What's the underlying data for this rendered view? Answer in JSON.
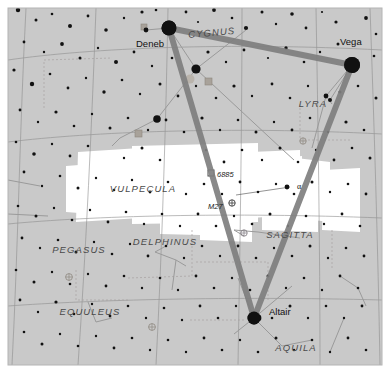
{
  "map": {
    "title": "Summer Triangle star chart",
    "width": 390,
    "height": 373,
    "background_color": "#ffffff",
    "sky_fill_color": "#c9c9c9",
    "milky_way_color": "#ffffff",
    "grid_line_color": "#8e8e8e",
    "border_color": "#b4b4b4",
    "asterism_line_color": "#7f7f7f",
    "constellation_line_color": "#9a9a9a",
    "star_color": "#111111",
    "dso_marker_color": "#a09a90"
  },
  "constellations": [
    {
      "name": "CYGNUS",
      "x": 212,
      "y": 36,
      "rotation": -5
    },
    {
      "name": "LYRA",
      "x": 313,
      "y": 107,
      "rotation": 0
    },
    {
      "name": "VULPECULA",
      "x": 143,
      "y": 192,
      "rotation": 0
    },
    {
      "name": "PEGASUS",
      "x": 79,
      "y": 253,
      "rotation": 0
    },
    {
      "name": "DELPHINUS",
      "x": 165,
      "y": 245,
      "rotation": 0
    },
    {
      "name": "SAGITTA",
      "x": 290,
      "y": 238,
      "rotation": 0
    },
    {
      "name": "EQUULEUS",
      "x": 90,
      "y": 315,
      "rotation": 0
    },
    {
      "name": "AQUILA",
      "x": 296,
      "y": 351,
      "rotation": 0
    }
  ],
  "named_stars": [
    {
      "name": "Deneb",
      "label_x": 136,
      "label_y": 47,
      "x": 169,
      "y": 28,
      "r": 7.5
    },
    {
      "name": "Vega",
      "label_x": 340,
      "label_y": 45,
      "x": 352,
      "y": 65,
      "r": 8.0
    },
    {
      "name": "Altair",
      "label_x": 269,
      "label_y": 315,
      "x": 254,
      "y": 318,
      "r": 6.5
    }
  ],
  "deep_sky_objects": [
    {
      "name": "6885",
      "label_x": 217,
      "label_y": 177,
      "marker_x": 211,
      "marker_y": 173,
      "type": "open-cluster"
    },
    {
      "name": "M27",
      "label_x": 208,
      "label_y": 209,
      "marker_x": 232,
      "marker_y": 203,
      "type": "planetary-nebula"
    }
  ],
  "greek_labels": [
    {
      "name": "α",
      "x": 297,
      "y": 189,
      "star_x": 287,
      "star_y": 187
    }
  ],
  "asterism": {
    "name": "Summer Triangle",
    "vertices": [
      {
        "star": "Deneb",
        "x": 169,
        "y": 28
      },
      {
        "star": "Vega",
        "x": 352,
        "y": 65
      },
      {
        "star": "Altair",
        "x": 254,
        "y": 318
      }
    ]
  },
  "chart_data": {
    "type": "scatter",
    "xlabel": "",
    "ylabel": "",
    "grid": true,
    "legend_position": "none",
    "note": "Star positions in pixel coordinates; radius encodes apparent magnitude (larger = brighter).",
    "stars": [
      [
        169,
        28,
        7.5
      ],
      [
        352,
        65,
        8.0
      ],
      [
        254,
        318,
        6.5
      ],
      [
        196,
        69,
        4.6
      ],
      [
        157,
        119,
        3.8
      ],
      [
        258,
        318,
        3.4
      ],
      [
        18,
        10,
        2.2
      ],
      [
        36,
        20,
        1.5
      ],
      [
        52,
        14,
        1.3
      ],
      [
        70,
        26,
        2.0
      ],
      [
        88,
        16,
        1.4
      ],
      [
        106,
        30,
        1.8
      ],
      [
        124,
        18,
        1.2
      ],
      [
        142,
        12,
        1.6
      ],
      [
        146,
        30,
        2.4
      ],
      [
        156,
        10,
        1.3
      ],
      [
        186,
        12,
        1.4
      ],
      [
        198,
        22,
        1.1
      ],
      [
        214,
        10,
        1.9
      ],
      [
        232,
        18,
        1.3
      ],
      [
        246,
        28,
        2.1
      ],
      [
        262,
        12,
        1.5
      ],
      [
        276,
        24,
        1.2
      ],
      [
        292,
        14,
        1.8
      ],
      [
        306,
        28,
        1.4
      ],
      [
        322,
        12,
        1.1
      ],
      [
        336,
        22,
        1.6
      ],
      [
        366,
        18,
        1.9
      ],
      [
        376,
        34,
        1.3
      ],
      [
        24,
        42,
        1.4
      ],
      [
        44,
        52,
        1.2
      ],
      [
        62,
        44,
        1.9
      ],
      [
        80,
        58,
        1.5
      ],
      [
        98,
        48,
        1.2
      ],
      [
        116,
        62,
        2.0
      ],
      [
        134,
        52,
        1.4
      ],
      [
        152,
        66,
        1.2
      ],
      [
        172,
        58,
        1.3
      ],
      [
        208,
        52,
        1.6
      ],
      [
        226,
        62,
        1.2
      ],
      [
        244,
        50,
        1.4
      ],
      [
        268,
        58,
        1.1
      ],
      [
        286,
        48,
        1.7
      ],
      [
        304,
        62,
        1.3
      ],
      [
        320,
        52,
        1.2
      ],
      [
        338,
        44,
        1.5
      ],
      [
        374,
        56,
        1.3
      ],
      [
        14,
        70,
        1.6
      ],
      [
        32,
        84,
        2.2
      ],
      [
        50,
        74,
        1.3
      ],
      [
        68,
        88,
        1.4
      ],
      [
        86,
        78,
        1.2
      ],
      [
        104,
        92,
        1.7
      ],
      [
        122,
        80,
        1.3
      ],
      [
        140,
        94,
        1.2
      ],
      [
        160,
        84,
        1.5
      ],
      [
        178,
        96,
        1.4
      ],
      [
        196,
        86,
        1.2
      ],
      [
        216,
        98,
        1.3
      ],
      [
        234,
        86,
        1.6
      ],
      [
        252,
        96,
        1.2
      ],
      [
        272,
        84,
        1.4
      ],
      [
        290,
        98,
        1.3
      ],
      [
        308,
        86,
        1.2
      ],
      [
        326,
        96,
        2.4
      ],
      [
        330,
        100,
        2.0
      ],
      [
        340,
        92,
        1.5
      ],
      [
        358,
        86,
        1.3
      ],
      [
        376,
        98,
        1.5
      ],
      [
        20,
        110,
        1.4
      ],
      [
        38,
        122,
        1.2
      ],
      [
        56,
        112,
        1.6
      ],
      [
        74,
        126,
        1.3
      ],
      [
        92,
        114,
        1.2
      ],
      [
        110,
        128,
        1.5
      ],
      [
        128,
        118,
        1.3
      ],
      [
        148,
        130,
        1.2
      ],
      [
        166,
        120,
        1.4
      ],
      [
        184,
        132,
        1.3
      ],
      [
        202,
        118,
        1.6
      ],
      [
        220,
        130,
        1.2
      ],
      [
        238,
        120,
        1.3
      ],
      [
        256,
        132,
        1.5
      ],
      [
        274,
        122,
        1.2
      ],
      [
        292,
        130,
        1.4
      ],
      [
        310,
        118,
        1.3
      ],
      [
        328,
        132,
        1.2
      ],
      [
        346,
        122,
        1.6
      ],
      [
        364,
        130,
        1.3
      ],
      [
        16,
        142,
        1.3
      ],
      [
        34,
        154,
        1.8
      ],
      [
        52,
        144,
        1.2
      ],
      [
        70,
        156,
        1.4
      ],
      [
        88,
        146,
        1.3
      ],
      [
        124,
        158,
        1.2
      ],
      [
        142,
        148,
        1.5
      ],
      [
        160,
        160,
        1.3
      ],
      [
        206,
        150,
        1.2
      ],
      [
        224,
        162,
        1.4
      ],
      [
        242,
        150,
        1.3
      ],
      [
        262,
        160,
        1.2
      ],
      [
        280,
        148,
        1.5
      ],
      [
        298,
        162,
        1.3
      ],
      [
        316,
        150,
        1.2
      ],
      [
        334,
        160,
        1.4
      ],
      [
        352,
        148,
        1.3
      ],
      [
        370,
        158,
        1.5
      ],
      [
        24,
        172,
        1.4
      ],
      [
        42,
        186,
        1.2
      ],
      [
        60,
        176,
        1.3
      ],
      [
        78,
        188,
        1.5
      ],
      [
        96,
        178,
        1.2
      ],
      [
        114,
        190,
        1.3
      ],
      [
        132,
        180,
        1.2
      ],
      [
        150,
        192,
        1.4
      ],
      [
        168,
        182,
        1.3
      ],
      [
        186,
        194,
        1.2
      ],
      [
        204,
        184,
        1.3
      ],
      [
        222,
        194,
        1.2
      ],
      [
        240,
        182,
        1.4
      ],
      [
        258,
        192,
        1.3
      ],
      [
        276,
        184,
        1.2
      ],
      [
        294,
        194,
        1.3
      ],
      [
        312,
        182,
        1.5
      ],
      [
        330,
        192,
        1.2
      ],
      [
        348,
        184,
        1.3
      ],
      [
        366,
        194,
        1.4
      ],
      [
        18,
        206,
        1.3
      ],
      [
        36,
        216,
        1.5
      ],
      [
        54,
        208,
        1.2
      ],
      [
        72,
        220,
        1.3
      ],
      [
        90,
        210,
        1.2
      ],
      [
        108,
        222,
        1.4
      ],
      [
        126,
        212,
        1.3
      ],
      [
        144,
        224,
        1.2
      ],
      [
        162,
        214,
        1.3
      ],
      [
        180,
        226,
        1.2
      ],
      [
        198,
        214,
        1.4
      ],
      [
        216,
        226,
        1.3
      ],
      [
        234,
        216,
        1.2
      ],
      [
        252,
        224,
        1.3
      ],
      [
        270,
        214,
        1.5
      ],
      [
        288,
        226,
        1.2
      ],
      [
        306,
        216,
        1.3
      ],
      [
        324,
        224,
        1.2
      ],
      [
        342,
        214,
        1.4
      ],
      [
        360,
        226,
        1.3
      ],
      [
        22,
        238,
        1.4
      ],
      [
        40,
        248,
        1.2
      ],
      [
        58,
        240,
        1.3
      ],
      [
        76,
        252,
        1.5
      ],
      [
        94,
        242,
        1.2
      ],
      [
        112,
        254,
        1.3
      ],
      [
        130,
        244,
        1.2
      ],
      [
        148,
        256,
        1.4
      ],
      [
        166,
        246,
        1.3
      ],
      [
        184,
        258,
        1.2
      ],
      [
        202,
        246,
        1.3
      ],
      [
        220,
        256,
        1.2
      ],
      [
        238,
        246,
        1.4
      ],
      [
        256,
        258,
        1.3
      ],
      [
        274,
        248,
        1.2
      ],
      [
        292,
        256,
        1.3
      ],
      [
        310,
        246,
        1.5
      ],
      [
        328,
        258,
        1.2
      ],
      [
        346,
        248,
        1.3
      ],
      [
        364,
        256,
        1.4
      ],
      [
        16,
        270,
        1.3
      ],
      [
        34,
        282,
        1.5
      ],
      [
        52,
        272,
        1.2
      ],
      [
        70,
        284,
        1.3
      ],
      [
        88,
        274,
        1.2
      ],
      [
        106,
        286,
        1.4
      ],
      [
        124,
        276,
        1.3
      ],
      [
        142,
        288,
        1.2
      ],
      [
        160,
        278,
        1.3
      ],
      [
        178,
        290,
        1.2
      ],
      [
        196,
        276,
        1.4
      ],
      [
        214,
        288,
        1.3
      ],
      [
        232,
        278,
        1.2
      ],
      [
        250,
        290,
        1.3
      ],
      [
        268,
        276,
        1.5
      ],
      [
        286,
        288,
        1.2
      ],
      [
        304,
        278,
        1.3
      ],
      [
        322,
        290,
        1.2
      ],
      [
        340,
        276,
        1.4
      ],
      [
        358,
        288,
        1.3
      ],
      [
        20,
        300,
        1.4
      ],
      [
        38,
        312,
        1.2
      ],
      [
        56,
        302,
        1.6
      ],
      [
        74,
        314,
        1.3
      ],
      [
        92,
        304,
        1.2
      ],
      [
        110,
        316,
        1.4
      ],
      [
        128,
        306,
        1.3
      ],
      [
        146,
        318,
        1.2
      ],
      [
        164,
        308,
        1.3
      ],
      [
        182,
        320,
        1.2
      ],
      [
        200,
        306,
        1.4
      ],
      [
        218,
        318,
        1.3
      ],
      [
        236,
        306,
        1.2
      ],
      [
        272,
        318,
        1.3
      ],
      [
        290,
        306,
        1.5
      ],
      [
        308,
        318,
        1.2
      ],
      [
        326,
        306,
        1.3
      ],
      [
        344,
        318,
        1.2
      ],
      [
        362,
        306,
        1.4
      ],
      [
        24,
        332,
        1.3
      ],
      [
        42,
        344,
        1.5
      ],
      [
        60,
        334,
        1.2
      ],
      [
        78,
        346,
        1.3
      ],
      [
        96,
        336,
        1.2
      ],
      [
        114,
        348,
        1.4
      ],
      [
        132,
        338,
        1.3
      ],
      [
        150,
        350,
        1.2
      ],
      [
        168,
        340,
        1.3
      ],
      [
        186,
        352,
        1.2
      ],
      [
        204,
        338,
        1.4
      ],
      [
        222,
        350,
        1.3
      ],
      [
        240,
        340,
        1.2
      ],
      [
        258,
        352,
        1.3
      ],
      [
        276,
        338,
        1.5
      ],
      [
        294,
        350,
        1.2
      ],
      [
        312,
        340,
        1.3
      ],
      [
        330,
        352,
        1.2
      ],
      [
        348,
        338,
        1.4
      ],
      [
        366,
        350,
        1.3
      ]
    ]
  }
}
